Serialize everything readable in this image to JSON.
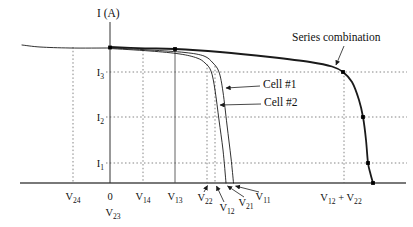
{
  "colors": {
    "curve": "#1a1a1a",
    "axis": "#4d4d4d",
    "guide": "#777777",
    "text": "#111111",
    "marker": "#000000"
  },
  "chart_data": {
    "type": "line",
    "title": "",
    "ylabel": "I (A)",
    "xlabel": "",
    "grid": "dotted construction guides only",
    "legend_position": "inline annotations with arrows",
    "axes": {
      "x_axis": {
        "y": 183,
        "x1": 20,
        "x2": 406
      },
      "y_axis": {
        "x": 110,
        "y1": 22,
        "y2": 183,
        "title": "I (A)",
        "title_xy": [
          97,
          17
        ]
      }
    },
    "y_ticks": [
      {
        "label": "I_{3}",
        "y": 72,
        "label_xy": [
          104,
          76
        ]
      },
      {
        "label": "I_{2}",
        "y": 117,
        "label_xy": [
          104,
          121
        ]
      },
      {
        "label": "I_{1}",
        "y": 163,
        "label_xy": [
          104,
          167
        ]
      }
    ],
    "x_ticks": [
      {
        "label": "V_{24}",
        "x": 73,
        "label_xy": [
          73,
          200
        ]
      },
      {
        "label": "0",
        "x": 110,
        "label_xy": [
          110,
          200
        ]
      },
      {
        "label": "V_{23}",
        "x": 113,
        "label_xy": [
          113,
          216
        ]
      },
      {
        "label": "V_{14}",
        "x": 143,
        "label_xy": [
          143,
          200
        ]
      },
      {
        "label": "V_{13}",
        "x": 175,
        "label_xy": [
          175,
          200
        ]
      },
      {
        "label": "V_{22}",
        "x": 207,
        "label_xy": [
          205,
          201
        ]
      },
      {
        "label": "V_{12}",
        "x": 216,
        "label_xy": [
          227,
          211
        ]
      },
      {
        "label": "V_{21}",
        "x": 227,
        "label_xy": [
          246,
          206
        ]
      },
      {
        "label": "V_{11}",
        "x": 235,
        "label_xy": [
          263,
          200
        ]
      },
      {
        "label": "V_{12} + V_{22}",
        "x": 344,
        "label_xy": [
          341,
          201
        ]
      }
    ],
    "guides": {
      "horizontal_dotted": [
        {
          "name": "I3-level",
          "y": 72,
          "x1": 106,
          "x2": 407
        },
        {
          "name": "I2-level",
          "y": 117,
          "x1": 106,
          "x2": 407
        },
        {
          "name": "I1-level",
          "y": 163,
          "x1": 106,
          "x2": 407
        }
      ],
      "vertical_dotted": [
        {
          "name": "V24-line",
          "x": 73,
          "y1": 47,
          "y2": 183
        },
        {
          "name": "V14-line",
          "x": 143,
          "y1": 50,
          "y2": 183
        },
        {
          "name": "V22-line",
          "x": 207,
          "y1": 64,
          "y2": 183
        },
        {
          "name": "V12-line",
          "x": 215,
          "y1": 66,
          "y2": 183
        },
        {
          "name": "V12+V22-line",
          "x": 344,
          "y1": 72,
          "y2": 183
        }
      ],
      "vertical_solid": [
        {
          "name": "V13-line",
          "x": 175,
          "y1": 49,
          "y2": 183
        }
      ]
    },
    "curves": [
      {
        "name": "reverse-tail",
        "stroke_width": 0.9,
        "points": [
          [
            22,
            45
          ],
          [
            40,
            47
          ],
          [
            70,
            48
          ],
          [
            109,
            48
          ]
        ]
      },
      {
        "name": "cell-2",
        "label": "Cell #2",
        "stroke_width": 0.9,
        "points": [
          [
            110,
            48.5
          ],
          [
            150,
            51
          ],
          [
            180,
            54
          ],
          [
            197,
            58
          ],
          [
            205,
            63
          ],
          [
            211,
            71
          ],
          [
            215,
            90
          ],
          [
            219,
            120
          ],
          [
            223,
            150
          ],
          [
            226,
            183
          ]
        ]
      },
      {
        "name": "cell-1",
        "label": "Cell #1",
        "stroke_width": 0.9,
        "points": [
          [
            110,
            47.8
          ],
          [
            150,
            50
          ],
          [
            185,
            52.5
          ],
          [
            204,
            56
          ],
          [
            213,
            63
          ],
          [
            219,
            72
          ],
          [
            223,
            92
          ],
          [
            227,
            125
          ],
          [
            231,
            158
          ],
          [
            233.5,
            183
          ]
        ]
      },
      {
        "name": "series-combination",
        "label": "Series combination",
        "stroke_width": 1.8,
        "points": [
          [
            110,
            47
          ],
          [
            145,
            48.3
          ],
          [
            175,
            49
          ],
          [
            220,
            52
          ],
          [
            270,
            57
          ],
          [
            310,
            62
          ],
          [
            332,
            66.5
          ],
          [
            343,
            72
          ],
          [
            352,
            82
          ],
          [
            359,
            100
          ],
          [
            363,
            117
          ],
          [
            366,
            140
          ],
          [
            368,
            163
          ],
          [
            370.5,
            174
          ],
          [
            373,
            183
          ]
        ]
      }
    ],
    "markers": [
      {
        "xy": [
          110,
          47.5
        ],
        "on": "series-combination"
      },
      {
        "xy": [
          175,
          49
        ],
        "on": "series-combination"
      },
      {
        "xy": [
          343,
          72
        ],
        "on": "series-combination"
      },
      {
        "xy": [
          363,
          117
        ],
        "on": "series-combination"
      },
      {
        "xy": [
          368,
          163
        ],
        "on": "series-combination"
      },
      {
        "xy": [
          373,
          183
        ],
        "on": "series-combination"
      }
    ],
    "annotations": [
      {
        "name": "series-combination-label",
        "text": "Series combination",
        "xy": [
          292,
          41
        ],
        "anchor": "start",
        "arrow": {
          "from": [
            344,
            46
          ],
          "to": [
            336,
            65
          ]
        }
      },
      {
        "name": "cell-1-label",
        "text": "Cell #1",
        "xy": [
          263,
          88
        ],
        "anchor": "start",
        "arrow": {
          "from": [
            260,
            86
          ],
          "to": [
            226,
            88
          ]
        }
      },
      {
        "name": "cell-2-label",
        "text": "Cell #2",
        "xy": [
          264,
          106
        ],
        "anchor": "start",
        "arrow": {
          "from": [
            261,
            104
          ],
          "to": [
            220,
            105
          ]
        }
      }
    ],
    "leader_arrows": [
      {
        "for": "V_{22}",
        "from": [
          204,
          192
        ],
        "to": [
          207.5,
          185.5
        ]
      },
      {
        "for": "V_{12}",
        "from": [
          224,
          202
        ],
        "to": [
          216.5,
          186
        ]
      },
      {
        "for": "V_{21}",
        "from": [
          244,
          197
        ],
        "to": [
          227.5,
          186
        ]
      },
      {
        "for": "V_{11}",
        "from": [
          259,
          192
        ],
        "to": [
          235.5,
          186
        ]
      }
    ]
  }
}
